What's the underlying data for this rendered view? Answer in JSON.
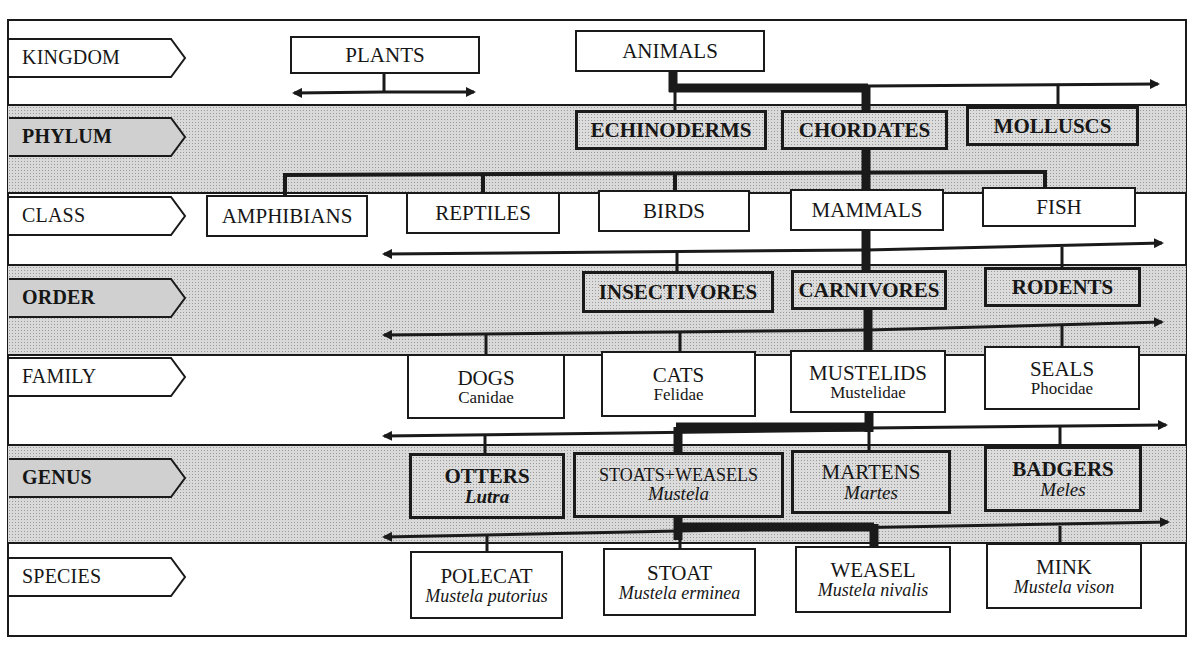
{
  "diagram": {
    "ranks": [
      {
        "label": "KINGDOM",
        "shaded": false
      },
      {
        "label": "PHYLUM",
        "shaded": true
      },
      {
        "label": "CLASS",
        "shaded": false
      },
      {
        "label": "ORDER",
        "shaded": true
      },
      {
        "label": "FAMILY",
        "shaded": false
      },
      {
        "label": "GENUS",
        "shaded": true
      },
      {
        "label": "SPECIES",
        "shaded": false
      }
    ],
    "kingdom": [
      {
        "name": "PLANTS"
      },
      {
        "name": "ANIMALS"
      }
    ],
    "phylum": [
      {
        "name": "ECHINODERMS"
      },
      {
        "name": "CHORDATES"
      },
      {
        "name": "MOLLUSCS"
      }
    ],
    "class": [
      {
        "name": "AMPHIBIANS"
      },
      {
        "name": "REPTILES"
      },
      {
        "name": "BIRDS"
      },
      {
        "name": "MAMMALS"
      },
      {
        "name": "FISH"
      }
    ],
    "order": [
      {
        "name": "INSECTIVORES"
      },
      {
        "name": "CARNIVORES"
      },
      {
        "name": "RODENTS"
      }
    ],
    "family": [
      {
        "name": "DOGS",
        "latin": "Canidae"
      },
      {
        "name": "CATS",
        "latin": "Felidae"
      },
      {
        "name": "MUSTELIDS",
        "latin": "Mustelidae"
      },
      {
        "name": "SEALS",
        "latin": "Phocidae"
      }
    ],
    "genus": [
      {
        "name": "OTTERS",
        "latin": "Lutra"
      },
      {
        "name": "STOATS+WEASELS",
        "latin": "Mustela"
      },
      {
        "name": "MARTENS",
        "latin": "Martes"
      },
      {
        "name": "BADGERS",
        "latin": "Meles"
      }
    ],
    "species": [
      {
        "name": "POLECAT",
        "latin": "Mustela putorius"
      },
      {
        "name": "STOAT",
        "latin": "Mustela erminea"
      },
      {
        "name": "WEASEL",
        "latin": "Mustela nivalis"
      },
      {
        "name": "MINK",
        "latin": "Mustela vison"
      }
    ],
    "colors": {
      "ink": "#1a1a1a",
      "band_fill": "#d9d9d9",
      "paper": "#ffffff"
    },
    "highlighted_path": [
      "ANIMALS",
      "CHORDATES",
      "MAMMALS",
      "CARNIVORES",
      "MUSTELIDS",
      "STOATS+WEASELS",
      "STOAT",
      "WEASEL"
    ]
  }
}
